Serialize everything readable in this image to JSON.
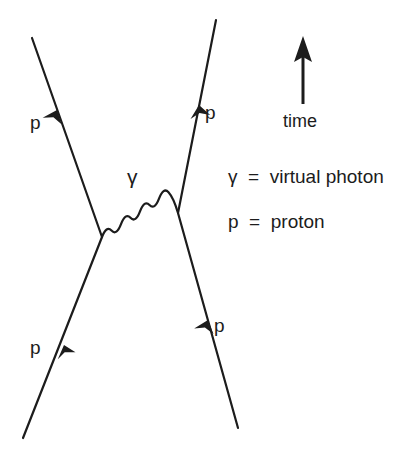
{
  "diagram": {
    "background_color": "#ffffff",
    "stroke_color": "#1c1c1c",
    "particle_lines": [
      {
        "name": "incoming-proton-left",
        "label": "p",
        "label_x": 30,
        "label_y": 352,
        "from": [
          23,
          438
        ],
        "to": [
          102,
          237
        ],
        "arrow_at": 0.52
      },
      {
        "name": "outgoing-proton-left",
        "label": "p",
        "label_x": 30,
        "label_y": 127,
        "from": [
          102,
          237
        ],
        "to": [
          32,
          38
        ],
        "arrow_at": 0.64
      },
      {
        "name": "incoming-proton-right",
        "label": "p",
        "label_x": 214,
        "label_y": 330,
        "from": [
          238,
          428
        ],
        "to": [
          178,
          213
        ],
        "arrow_at": 0.5
      },
      {
        "name": "outgoing-proton-right",
        "label": "p",
        "label_x": 205,
        "label_y": 118,
        "from": [
          178,
          213
        ],
        "to": [
          216,
          20
        ],
        "arrow_at": 0.56
      }
    ],
    "photon": {
      "name": "virtual-photon-wavy-line",
      "label": "γ",
      "label_x": 127,
      "label_y": 167,
      "from": [
        102,
        237
      ],
      "to": [
        178,
        213
      ],
      "wavelength_count": 7,
      "amplitude": 9
    },
    "time_arrow": {
      "name": "time-arrow",
      "label": "time",
      "label_x": 281,
      "label_y": 114,
      "tip": [
        303,
        38
      ],
      "tail": [
        303,
        104
      ]
    },
    "legend": [
      {
        "name": "legend-gamma",
        "symbol": "γ",
        "equals": "=",
        "text": "virtual photon",
        "full": "γ  =  virtual photon",
        "x": 228,
        "y": 177
      },
      {
        "name": "legend-proton",
        "symbol": "p",
        "equals": "=",
        "text": "proton",
        "full": "p  =  proton",
        "x": 228,
        "y": 222
      }
    ]
  }
}
